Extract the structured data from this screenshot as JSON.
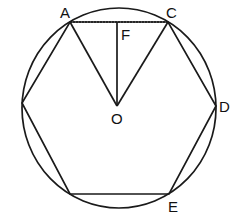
{
  "diagram": {
    "type": "geometry",
    "circle": {
      "cx": 119,
      "cy": 108,
      "rx": 97,
      "ry": 100
    },
    "points": {
      "A": {
        "x": 70,
        "y": 22,
        "label": "A"
      },
      "C": {
        "x": 168,
        "y": 22,
        "label": "C"
      },
      "D": {
        "x": 216,
        "y": 106,
        "label": "D"
      },
      "E": {
        "x": 169,
        "y": 194,
        "label": "E"
      },
      "BL": {
        "x": 70,
        "y": 194,
        "label": ""
      },
      "L": {
        "x": 22,
        "y": 103,
        "label": ""
      },
      "O": {
        "x": 117,
        "y": 106,
        "label": "O"
      },
      "F": {
        "x": 117,
        "y": 22,
        "label": "F"
      }
    },
    "labels": {
      "A": "A",
      "C": "C",
      "D": "D",
      "E": "E",
      "O": "O",
      "F": "F"
    }
  }
}
